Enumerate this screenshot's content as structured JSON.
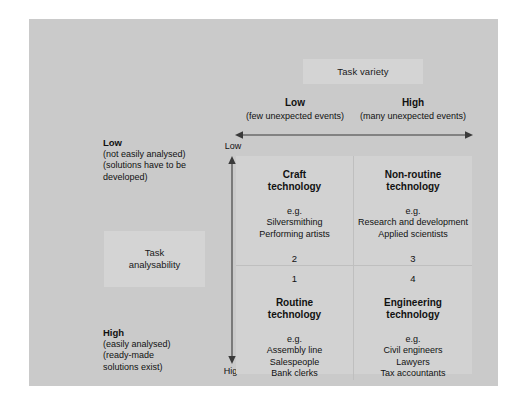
{
  "figure": {
    "kind": "2x2-matrix-diagram",
    "x_axis": {
      "caption": "Task variety",
      "arrow": "double-headed-horizontal-arrow",
      "columns": [
        {
          "title": "Low",
          "sub": "(few unexpected events)"
        },
        {
          "title": "High",
          "sub": "(many unexpected events)"
        }
      ]
    },
    "y_axis": {
      "caption_line1": "Task",
      "caption_line2": "analysability",
      "arrow": "double-headed-vertical-arrow",
      "tick_top": "Low",
      "tick_bottom": "High",
      "rows": [
        {
          "title": "Low",
          "sub": "(not easily analysed)\n(solutions have to be\ndeveloped)"
        },
        {
          "title": "High",
          "sub": "(easily analysed)\n(ready-made\nsolutions exist)"
        }
      ]
    },
    "quadrants": {
      "top_left": {
        "title": "Craft\ntechnology",
        "eg_label": "e.g.",
        "examples": "Silversmithing\nPerforming artists",
        "number": "2"
      },
      "top_right": {
        "title": "Non-routine\ntechnology",
        "eg_label": "e.g.",
        "examples": "Research and development\nApplied scientists",
        "number": "3"
      },
      "bottom_left": {
        "title": "Routine\ntechnology",
        "eg_label": "e.g.",
        "examples": "Assembly line\nSalespeople\nBank clerks",
        "number": "1"
      },
      "bottom_right": {
        "title": "Engineering\ntechnology",
        "eg_label": "e.g.",
        "examples": "Civil engineers\nLawyers\nTax accountants",
        "number": "4"
      }
    },
    "colors": {
      "page": "#ffffff",
      "panel": "#cacaca",
      "matrix": "#d2d2d2",
      "caption_box": "#d4d4d4",
      "grid_line": "#bfbfbf",
      "text": "#111111",
      "arrow": "#3a3a3a"
    }
  }
}
